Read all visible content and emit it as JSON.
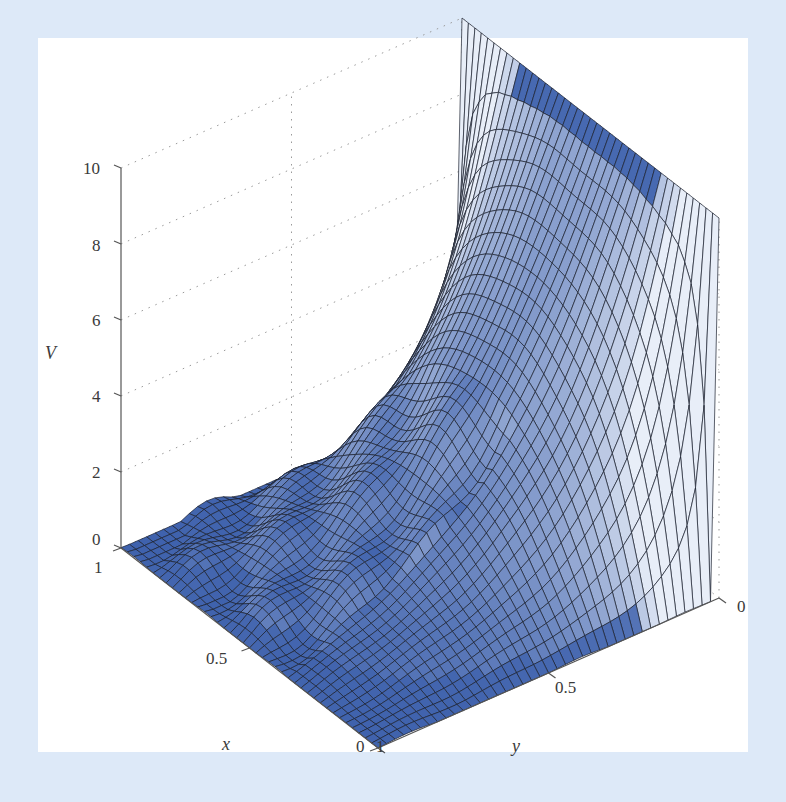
{
  "figure": {
    "background_color": "#dde9f8",
    "panel_color": "#ffffff",
    "surface_base_color": "#3f62ad",
    "surface_highlight_color": "#e8eef8",
    "mesh_line_color": "#1a1f2e"
  },
  "chart_data": {
    "type": "surface3d",
    "title": "",
    "xlabel": "x",
    "ylabel": "y",
    "zlabel": "V",
    "x_ticks": [
      "1",
      "0.5",
      "0"
    ],
    "y_ticks": [
      "1",
      "0.5",
      "0"
    ],
    "z_ticks": [
      "0",
      "2",
      "4",
      "6",
      "8",
      "10"
    ],
    "xlim": [
      0,
      1
    ],
    "ylim": [
      0,
      1
    ],
    "zlim": [
      0,
      10
    ],
    "grid": true,
    "colormap": "blue shading (dark blue at low/flat, pale at steep curved region)",
    "mesh_resolution": [
      40,
      40
    ],
    "boundary_values": {
      "y=0": 10,
      "y=1": 0,
      "x=0": 0,
      "x=1": 0
    },
    "sample_profile": {
      "note": "approximate V along x=0.5 as a function of y",
      "y": [
        0,
        0.1,
        0.2,
        0.3,
        0.4,
        0.5,
        0.6,
        0.7,
        0.8,
        0.9,
        1.0
      ],
      "V": [
        10,
        7.4,
        5.3,
        3.8,
        2.6,
        1.8,
        1.1,
        0.7,
        0.4,
        0.2,
        0
      ]
    }
  },
  "axes": {
    "z_axis_label": "V",
    "x_axis_label": "x",
    "y_axis_label": "y",
    "z_tick_labels": [
      {
        "text": "10",
        "left": 83,
        "top": 160
      },
      {
        "text": "8",
        "left": 92,
        "top": 237
      },
      {
        "text": "6",
        "left": 92,
        "top": 312
      },
      {
        "text": "4",
        "left": 92,
        "top": 388
      },
      {
        "text": "2",
        "left": 92,
        "top": 464
      },
      {
        "text": "0",
        "left": 92,
        "top": 531
      }
    ],
    "x_tick_labels": [
      {
        "text": "1",
        "left": 94,
        "top": 559
      },
      {
        "text": "0.5",
        "left": 206,
        "top": 650
      },
      {
        "text": "0",
        "left": 356,
        "top": 738
      }
    ],
    "y_tick_labels": [
      {
        "text": "1",
        "left": 376,
        "top": 738
      },
      {
        "text": "0.5",
        "left": 555,
        "top": 679
      },
      {
        "text": "0",
        "left": 737,
        "top": 598
      }
    ]
  }
}
